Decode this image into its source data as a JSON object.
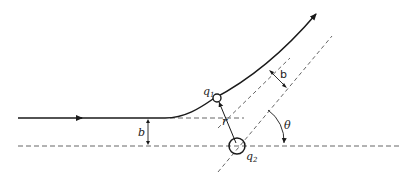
{
  "diagram": {
    "labels": {
      "q1": "q",
      "q1_sub": "1",
      "q2": "q",
      "q2_sub": "2",
      "r": "r",
      "b_incoming": "b",
      "b_outgoing": "b",
      "theta": "θ"
    },
    "elements": [
      "incoming-trajectory",
      "outgoing-trajectory",
      "baseline-axis",
      "incoming-asymptote",
      "outgoing-asymptote",
      "q2-asymptote-parallel",
      "charge-q1",
      "charge-q2",
      "separation-vector-r",
      "impact-parameter-b",
      "scattering-angle-theta"
    ],
    "colors": {
      "stroke": "#1a1a1a",
      "dashed": "#555555"
    }
  }
}
